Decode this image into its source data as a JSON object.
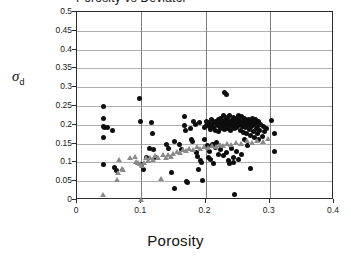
{
  "figure": {
    "title_partial": "Porosity vs Deviator",
    "plot_bg": "#ffffff",
    "frame_color": "#2b2b2b",
    "grid_color_h": "#b0b0b0",
    "grid_color_v": "#7d7d7d"
  },
  "axes": {
    "x_label": "Porosity",
    "y_label_symbol": "σ",
    "y_label_sub": "d",
    "x_ticks": [
      "0",
      "0.1",
      "0.2",
      "0.3",
      "0.4"
    ],
    "y_ticks": [
      "0",
      "0.05",
      "0.1",
      "0.15",
      "0.2",
      "0.25",
      "0.3",
      "0.35",
      "0.4",
      "0.45",
      "0.5"
    ]
  },
  "chart_data": {
    "type": "scatter",
    "title": "Porosity vs Deviator",
    "xlabel": "Porosity",
    "ylabel": "σd",
    "xlim": [
      0,
      0.4
    ],
    "ylim": [
      0,
      0.5
    ],
    "xticks": [
      0,
      0.1,
      0.2,
      0.3,
      0.4
    ],
    "yticks": [
      0,
      0.05,
      0.1,
      0.15,
      0.2,
      0.25,
      0.3,
      0.35,
      0.4,
      0.45,
      0.5
    ],
    "grid": true,
    "legend": null,
    "series": [
      {
        "name": "black-circles",
        "marker": "circle",
        "color": "#0d0d0d",
        "points": [
          [
            0.041,
            0.25
          ],
          [
            0.042,
            0.216
          ],
          [
            0.041,
            0.196
          ],
          [
            0.043,
            0.193
          ],
          [
            0.047,
            0.192
          ],
          [
            0.042,
            0.165
          ],
          [
            0.055,
            0.186
          ],
          [
            0.041,
            0.094
          ],
          [
            0.059,
            0.087
          ],
          [
            0.062,
            0.079
          ],
          [
            0.098,
            0.269
          ],
          [
            0.099,
            0.208
          ],
          [
            0.1,
            0.095
          ],
          [
            0.103,
            0.08
          ],
          [
            0.108,
            0.112
          ],
          [
            0.113,
            0.136
          ],
          [
            0.116,
            0.207
          ],
          [
            0.118,
            0.176
          ],
          [
            0.119,
            0.133
          ],
          [
            0.122,
            0.112
          ],
          [
            0.14,
            0.148
          ],
          [
            0.143,
            0.136
          ],
          [
            0.147,
            0.072
          ],
          [
            0.152,
            0.156
          ],
          [
            0.152,
            0.031
          ],
          [
            0.16,
            0.148
          ],
          [
            0.163,
            0.133
          ],
          [
            0.167,
            0.223
          ],
          [
            0.168,
            0.199
          ],
          [
            0.169,
            0.186
          ],
          [
            0.17,
            0.049
          ],
          [
            0.172,
            0.046
          ],
          [
            0.176,
            0.19
          ],
          [
            0.178,
            0.162
          ],
          [
            0.18,
            0.155
          ],
          [
            0.182,
            0.209
          ],
          [
            0.184,
            0.201
          ],
          [
            0.186,
            0.126
          ],
          [
            0.188,
            0.117
          ],
          [
            0.189,
            0.081
          ],
          [
            0.191,
            0.205
          ],
          [
            0.192,
            0.104
          ],
          [
            0.194,
            0.101
          ],
          [
            0.196,
            0.052
          ],
          [
            0.198,
            0.193
          ],
          [
            0.199,
            0.161
          ],
          [
            0.201,
            0.21
          ],
          [
            0.202,
            0.198
          ],
          [
            0.203,
            0.145
          ],
          [
            0.205,
            0.205
          ],
          [
            0.206,
            0.196
          ],
          [
            0.207,
            0.13
          ],
          [
            0.208,
            0.188
          ],
          [
            0.209,
            0.202
          ],
          [
            0.21,
            0.215
          ],
          [
            0.211,
            0.148
          ],
          [
            0.212,
            0.098
          ],
          [
            0.213,
            0.192
          ],
          [
            0.214,
            0.205
          ],
          [
            0.215,
            0.21
          ],
          [
            0.216,
            0.186
          ],
          [
            0.217,
            0.154
          ],
          [
            0.218,
            0.203
          ],
          [
            0.219,
            0.197
          ],
          [
            0.22,
            0.214
          ],
          [
            0.221,
            0.182
          ],
          [
            0.222,
            0.206
          ],
          [
            0.223,
            0.19
          ],
          [
            0.224,
            0.216
          ],
          [
            0.225,
            0.201
          ],
          [
            0.226,
            0.209
          ],
          [
            0.227,
            0.196
          ],
          [
            0.228,
            0.224
          ],
          [
            0.229,
            0.187
          ],
          [
            0.229,
            0.285
          ],
          [
            0.233,
            0.281
          ],
          [
            0.23,
            0.203
          ],
          [
            0.231,
            0.213
          ],
          [
            0.232,
            0.197
          ],
          [
            0.233,
            0.206
          ],
          [
            0.234,
            0.219
          ],
          [
            0.235,
            0.19
          ],
          [
            0.236,
            0.208
          ],
          [
            0.237,
            0.199
          ],
          [
            0.238,
            0.225
          ],
          [
            0.239,
            0.184
          ],
          [
            0.24,
            0.211
          ],
          [
            0.241,
            0.202
          ],
          [
            0.242,
            0.196
          ],
          [
            0.243,
            0.22
          ],
          [
            0.244,
            0.207
          ],
          [
            0.245,
            0.189
          ],
          [
            0.246,
            0.213
          ],
          [
            0.247,
            0.2
          ],
          [
            0.248,
            0.218
          ],
          [
            0.249,
            0.194
          ],
          [
            0.25,
            0.207
          ],
          [
            0.251,
            0.226
          ],
          [
            0.252,
            0.199
          ],
          [
            0.253,
            0.212
          ],
          [
            0.254,
            0.186
          ],
          [
            0.255,
            0.204
          ],
          [
            0.256,
            0.221
          ],
          [
            0.257,
            0.195
          ],
          [
            0.258,
            0.209
          ],
          [
            0.259,
            0.18
          ],
          [
            0.26,
            0.216
          ],
          [
            0.261,
            0.201
          ],
          [
            0.262,
            0.193
          ],
          [
            0.263,
            0.211
          ],
          [
            0.264,
            0.176
          ],
          [
            0.265,
            0.205
          ],
          [
            0.266,
            0.198
          ],
          [
            0.267,
            0.214
          ],
          [
            0.268,
            0.188
          ],
          [
            0.269,
            0.202
          ],
          [
            0.27,
            0.171
          ],
          [
            0.271,
            0.209
          ],
          [
            0.272,
            0.196
          ],
          [
            0.273,
            0.218
          ],
          [
            0.274,
            0.183
          ],
          [
            0.275,
            0.206
          ],
          [
            0.276,
            0.165
          ],
          [
            0.277,
            0.2
          ],
          [
            0.278,
            0.213
          ],
          [
            0.279,
            0.191
          ],
          [
            0.28,
            0.204
          ],
          [
            0.281,
            0.178
          ],
          [
            0.282,
            0.197
          ],
          [
            0.283,
            0.209
          ],
          [
            0.284,
            0.186
          ],
          [
            0.285,
            0.202
          ],
          [
            0.288,
            0.17
          ],
          [
            0.29,
            0.195
          ],
          [
            0.292,
            0.183
          ],
          [
            0.295,
            0.191
          ],
          [
            0.205,
            0.112
          ],
          [
            0.208,
            0.108
          ],
          [
            0.212,
            0.147
          ],
          [
            0.216,
            0.14
          ],
          [
            0.22,
            0.12
          ],
          [
            0.224,
            0.133
          ],
          [
            0.228,
            0.118
          ],
          [
            0.232,
            0.126
          ],
          [
            0.236,
            0.104
          ],
          [
            0.24,
            0.136
          ],
          [
            0.244,
            0.113
          ],
          [
            0.248,
            0.129
          ],
          [
            0.252,
            0.107
          ],
          [
            0.256,
            0.122
          ],
          [
            0.238,
            0.098
          ],
          [
            0.244,
            0.1
          ],
          [
            0.245,
            0.015
          ],
          [
            0.265,
            0.146
          ],
          [
            0.27,
            0.083
          ],
          [
            0.302,
            0.211
          ],
          [
            0.308,
            0.176
          ],
          [
            0.308,
            0.128
          ],
          [
            0.26,
            0.162
          ],
          [
            0.282,
            0.16
          ]
        ]
      },
      {
        "name": "gray-triangles",
        "marker": "triangle",
        "color": "#8a8a8a",
        "points": [
          [
            0.04,
            0.015
          ],
          [
            0.062,
            0.055
          ],
          [
            0.064,
            0.073
          ],
          [
            0.066,
            0.108
          ],
          [
            0.07,
            0.085
          ],
          [
            0.072,
            0.081
          ],
          [
            0.083,
            0.112
          ],
          [
            0.09,
            0.115
          ],
          [
            0.092,
            0.103
          ],
          [
            0.095,
            0.099
          ],
          [
            0.098,
            0.096
          ],
          [
            0.1,
            0.002
          ],
          [
            0.101,
            0.093
          ],
          [
            0.104,
            0.1
          ],
          [
            0.107,
            0.112
          ],
          [
            0.11,
            0.105
          ],
          [
            0.114,
            0.113
          ],
          [
            0.118,
            0.109
          ],
          [
            0.122,
            0.118
          ],
          [
            0.126,
            0.112
          ],
          [
            0.13,
            0.056
          ],
          [
            0.134,
            0.12
          ],
          [
            0.138,
            0.114
          ],
          [
            0.142,
            0.122
          ],
          [
            0.146,
            0.117
          ],
          [
            0.15,
            0.125
          ],
          [
            0.155,
            0.13
          ],
          [
            0.16,
            0.127
          ],
          [
            0.165,
            0.135
          ],
          [
            0.17,
            0.131
          ],
          [
            0.175,
            0.138
          ],
          [
            0.18,
            0.134
          ],
          [
            0.186,
            0.141
          ],
          [
            0.192,
            0.137
          ],
          [
            0.198,
            0.143
          ],
          [
            0.204,
            0.14
          ],
          [
            0.21,
            0.146
          ],
          [
            0.216,
            0.142
          ],
          [
            0.222,
            0.148
          ],
          [
            0.228,
            0.145
          ],
          [
            0.234,
            0.151
          ],
          [
            0.24,
            0.148
          ],
          [
            0.248,
            0.154
          ],
          [
            0.256,
            0.151
          ],
          [
            0.264,
            0.157
          ],
          [
            0.272,
            0.153
          ],
          [
            0.28,
            0.159
          ],
          [
            0.29,
            0.156
          ],
          [
            0.298,
            0.163
          ]
        ]
      }
    ]
  }
}
